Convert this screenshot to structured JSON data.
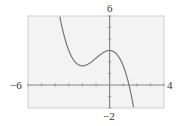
{
  "chart_data": {
    "type": "line",
    "title": "",
    "xlabel": "",
    "ylabel": "",
    "xlim": [
      -6,
      4
    ],
    "ylim": [
      -2,
      6
    ],
    "x_tick_step": 1,
    "y_tick_step": 1,
    "grid": false,
    "window_labels": {
      "xmin": "−6",
      "xmax": "4",
      "ymin": "−2",
      "ymax": "6"
    },
    "series": [
      {
        "name": "f(x)",
        "approx_function": "-x^3/3 - x^2 + 3",
        "x": [
          -3.6,
          -3.0,
          -2.5,
          -2.0,
          -1.5,
          -1.0,
          -0.5,
          0.0,
          0.5,
          1.0,
          1.4,
          1.8,
          2.0
        ],
        "y": [
          5.6,
          3.0,
          1.96,
          1.67,
          1.88,
          2.33,
          2.79,
          3.0,
          2.71,
          1.67,
          0.13,
          -1.99,
          -3.67
        ]
      }
    ],
    "key_points": {
      "local_min": [
        -2.0,
        1.67
      ],
      "local_max": [
        0.0,
        3.0
      ],
      "x_intercept": [
        1.4,
        0
      ]
    },
    "colors": {
      "background": "#f3f3f3",
      "axes": "#888888",
      "curve": "#777777",
      "frame": "#cfcfcf"
    }
  }
}
